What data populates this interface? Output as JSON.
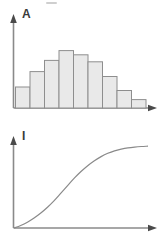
{
  "figure": {
    "title": "",
    "background_color": "#ffffff",
    "line_color": "#8a8a8a",
    "bar_fill_color": "#e9e9e9",
    "bar_border_color": "#8e8e8e",
    "label_color": "#3a3a3a",
    "width": 167,
    "height": 239
  },
  "panels": [
    {
      "id": "panel-a",
      "label": "A",
      "type": "histogram"
    },
    {
      "id": "panel-i",
      "label": "I",
      "type": "ogive"
    }
  ],
  "chart_data": [
    {
      "type": "bar",
      "id": "panel-a",
      "title": "A",
      "xlabel": "",
      "ylabel": "",
      "categories": [
        "1",
        "2",
        "3",
        "4",
        "5",
        "6",
        "7",
        "8",
        "9"
      ],
      "values": [
        30,
        52,
        68,
        82,
        76,
        66,
        45,
        25,
        12
      ],
      "ylim": [
        0,
        100
      ],
      "xlim": [
        0,
        9
      ],
      "grid": false,
      "legend": null,
      "axis_arrows": true,
      "tick_labels_x": [],
      "tick_labels_y": [],
      "annotations": []
    },
    {
      "type": "line",
      "id": "panel-i",
      "title": "I",
      "xlabel": "",
      "ylabel": "",
      "x": [
        0,
        5,
        10,
        15,
        20,
        25,
        30,
        35,
        40,
        45,
        50,
        55,
        60,
        65,
        70,
        75,
        80,
        85,
        90,
        95,
        100
      ],
      "series": [
        {
          "name": "cumulative",
          "values": [
            0,
            3,
            7,
            12,
            18,
            25,
            33,
            42,
            51,
            60,
            68,
            75,
            81,
            86,
            90,
            93,
            95,
            96.5,
            97.5,
            98.2,
            98.6
          ]
        }
      ],
      "ylim": [
        0,
        100
      ],
      "xlim": [
        0,
        100
      ],
      "grid": false,
      "legend": null,
      "axis_arrows": true,
      "tick_labels_x": [],
      "tick_labels_y": [],
      "annotations": []
    }
  ],
  "marks": {
    "top_smudge": ""
  }
}
